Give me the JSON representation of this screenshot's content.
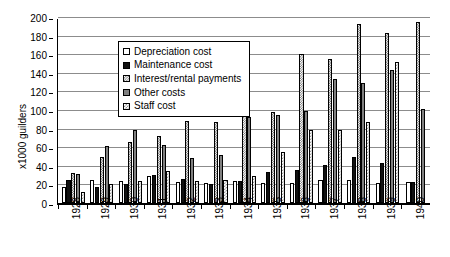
{
  "chart_data": {
    "type": "bar",
    "title": "",
    "xlabel": "",
    "ylabel": "x1000 guilders",
    "ylim": [
      0,
      200
    ],
    "ytick_step": 20,
    "yticks": [
      0,
      20,
      40,
      60,
      80,
      100,
      120,
      140,
      160,
      180,
      200
    ],
    "grid": true,
    "legend_position": "top-left-inside",
    "categories": [
      "1928",
      "1929",
      "1930",
      "1931",
      "1932",
      "1933",
      "1934",
      "1935",
      "1936",
      "1937",
      "1938",
      "1939",
      "1940"
    ],
    "series": [
      {
        "name": "Depreciation cost",
        "swatch": "light-dotted",
        "values": [
          17,
          25,
          24,
          29,
          23,
          21,
          24,
          22,
          22,
          25,
          25,
          22,
          23
        ]
      },
      {
        "name": "Maintenance cost",
        "swatch": "solid-black",
        "values": [
          25,
          17,
          20,
          30,
          26,
          20,
          24,
          33,
          36,
          41,
          49,
          43,
          23
        ]
      },
      {
        "name": "Interest/rental payments",
        "swatch": "medium-checker",
        "values": [
          32,
          50,
          66,
          72,
          88,
          87,
          95,
          98,
          160,
          155,
          193,
          183,
          195
        ]
      },
      {
        "name": "Other costs",
        "swatch": "solid-grey",
        "values": [
          31,
          61,
          79,
          62,
          48,
          52,
          92,
          95,
          99,
          133,
          129,
          143,
          101
        ]
      },
      {
        "name": "Staff cost",
        "swatch": "fine-checker",
        "values": [
          12,
          20,
          24,
          34,
          24,
          25,
          29,
          55,
          79,
          78,
          87,
          152,
          0
        ]
      }
    ]
  },
  "legend": {
    "items": [
      {
        "label": "Depreciation cost"
      },
      {
        "label": "Maintenance cost"
      },
      {
        "label": "Interest/rental payments"
      },
      {
        "label": "Other costs"
      },
      {
        "label": "Staff cost"
      }
    ]
  }
}
